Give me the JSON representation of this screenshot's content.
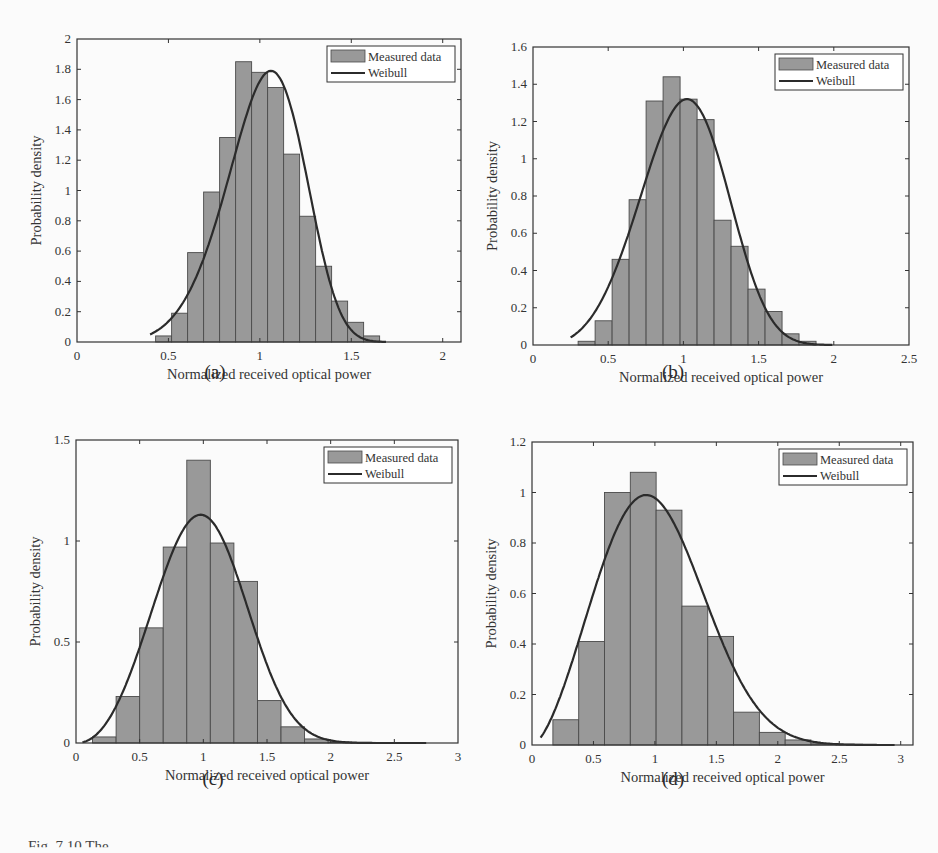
{
  "figure": {
    "caption_visible": "Fig. 7.10 The ...",
    "sublabels": [
      "(a)",
      "(b)",
      "(c)",
      "(d)"
    ],
    "colors": {
      "bar_fill": "#999999",
      "bar_edge": "#4a4a4a",
      "curve": "#2b2b2b",
      "axes": "#333333"
    }
  },
  "chart_data": [
    {
      "id": "a",
      "type": "bar",
      "title": "",
      "xlabel": "Normalized received optical power",
      "ylabel": "Probability density",
      "xlim": [
        0,
        2.1
      ],
      "ylim": [
        0,
        2
      ],
      "xticks": [
        0,
        0.5,
        1,
        1.5,
        2
      ],
      "xtick_labels": [
        "0",
        "0.5",
        "1",
        "1.5",
        "2"
      ],
      "yticks": [
        0,
        0.2,
        0.4,
        0.6,
        0.8,
        1,
        1.2,
        1.4,
        1.6,
        1.8,
        2
      ],
      "ytick_labels": [
        "0",
        "0.2",
        "0.4",
        "0.6",
        "0.8",
        "1",
        "1.2",
        "1.4",
        "1.6",
        "1.8",
        "2"
      ],
      "legend": [
        "Measured data",
        "Weibull"
      ],
      "legend_position": "upper right",
      "grid": false,
      "bin_start": 0.43,
      "bin_width": 0.0875,
      "values": [
        0.04,
        0.19,
        0.59,
        0.99,
        1.35,
        1.85,
        1.78,
        1.68,
        1.24,
        0.83,
        0.5,
        0.27,
        0.13,
        0.04
      ],
      "weibull": {
        "x_range": [
          0.4,
          1.7
        ],
        "peak_x": 1.05,
        "peak_y": 1.79,
        "scale": 1.1,
        "shape": 5.5
      }
    },
    {
      "id": "b",
      "type": "bar",
      "title": "",
      "xlabel": "Normalized received optical power",
      "ylabel": "Probability density",
      "xlim": [
        0,
        2.5
      ],
      "ylim": [
        0,
        1.6
      ],
      "xticks": [
        0,
        0.5,
        1,
        1.5,
        2,
        2.5
      ],
      "xtick_labels": [
        "0",
        "0.5",
        "1",
        "1.5",
        "2",
        "2.5"
      ],
      "yticks": [
        0,
        0.2,
        0.4,
        0.6,
        0.8,
        1,
        1.2,
        1.4,
        1.6
      ],
      "ytick_labels": [
        "0",
        "0.2",
        "0.4",
        "0.6",
        "0.8",
        "1",
        "1.2",
        "1.4",
        "1.6"
      ],
      "legend": [
        "Measured data",
        "Weibull"
      ],
      "legend_position": "upper right",
      "grid": false,
      "bin_start": 0.3,
      "bin_width": 0.113,
      "values": [
        0.02,
        0.13,
        0.46,
        0.78,
        1.31,
        1.44,
        1.32,
        1.21,
        0.67,
        0.53,
        0.3,
        0.18,
        0.06,
        0.02
      ],
      "weibull": {
        "x_range": [
          0.25,
          2.0
        ],
        "peak_x": 1.03,
        "peak_y": 1.32,
        "scale": 1.1,
        "shape": 4.0
      }
    },
    {
      "id": "c",
      "type": "bar",
      "title": "",
      "xlabel": "Normalized received optical power",
      "ylabel": "Probability density",
      "xlim": [
        0,
        3
      ],
      "ylim": [
        0,
        1.5
      ],
      "xticks": [
        0,
        0.5,
        1,
        1.5,
        2,
        2.5,
        3
      ],
      "xtick_labels": [
        "0",
        "0.5",
        "1",
        "1.5",
        "2",
        "2.5",
        "3"
      ],
      "yticks": [
        0,
        0.5,
        1,
        1.5
      ],
      "ytick_labels": [
        "0",
        "0.5",
        "1",
        "1.5"
      ],
      "legend": [
        "Measured data",
        "Weibull"
      ],
      "legend_position": "upper right",
      "grid": false,
      "bin_start": 0.13,
      "bin_width": 0.185,
      "values": [
        0.03,
        0.23,
        0.57,
        0.97,
        1.4,
        0.99,
        0.8,
        0.21,
        0.08,
        0.02,
        0.005,
        0.003,
        0.002,
        0.001
      ],
      "weibull": {
        "x_range": [
          0.05,
          2.75
        ],
        "peak_x": 1.0,
        "peak_y": 1.13,
        "scale": 1.1,
        "shape": 3.2
      }
    },
    {
      "id": "d",
      "type": "bar",
      "title": "",
      "xlabel": "Normalized received optical power",
      "ylabel": "Probability density",
      "xlim": [
        0,
        3.1
      ],
      "ylim": [
        0,
        1.2
      ],
      "xticks": [
        0,
        0.5,
        1,
        1.5,
        2,
        2.5,
        3
      ],
      "xtick_labels": [
        "0",
        "0.5",
        "1",
        "1.5",
        "2",
        "2.5",
        "3"
      ],
      "yticks": [
        0,
        0.2,
        0.4,
        0.6,
        0.8,
        1,
        1.2
      ],
      "ytick_labels": [
        "0",
        "0.2",
        "0.4",
        "0.6",
        "0.8",
        "1",
        "1.2"
      ],
      "legend": [
        "Measured data",
        "Weibull"
      ],
      "legend_position": "upper right",
      "grid": false,
      "bin_start": 0.17,
      "bin_width": 0.21,
      "values": [
        0.1,
        0.41,
        1.0,
        1.08,
        0.93,
        0.55,
        0.43,
        0.13,
        0.05,
        0.02,
        0.005,
        0.003,
        0.002
      ],
      "weibull": {
        "x_range": [
          0.07,
          2.95
        ],
        "peak_x": 0.97,
        "peak_y": 0.99,
        "scale": 1.12,
        "shape": 2.6
      }
    }
  ],
  "layout": {
    "panels": [
      {
        "id": "a",
        "left": 77,
        "top": 39,
        "width": 384,
        "height": 303,
        "label_x": 215,
        "label_y": 373
      },
      {
        "id": "b",
        "left": 533,
        "top": 47,
        "width": 376,
        "height": 298,
        "label_x": 673,
        "label_y": 373
      },
      {
        "id": "c",
        "left": 76,
        "top": 440,
        "width": 382,
        "height": 303,
        "label_x": 213,
        "label_y": 780
      },
      {
        "id": "d",
        "left": 532,
        "top": 442,
        "width": 381,
        "height": 303,
        "label_x": 673,
        "label_y": 780
      }
    ]
  }
}
